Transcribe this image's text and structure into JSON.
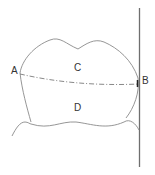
{
  "diagram": {
    "type": "tooth-section",
    "labels": {
      "point_a": "A",
      "point_b": "B",
      "region_upper": "C",
      "region_lower": "D"
    },
    "elements": [
      "crown-outline",
      "gum-line",
      "vertical-reference-line",
      "dash-dot-line-A-to-B"
    ]
  }
}
